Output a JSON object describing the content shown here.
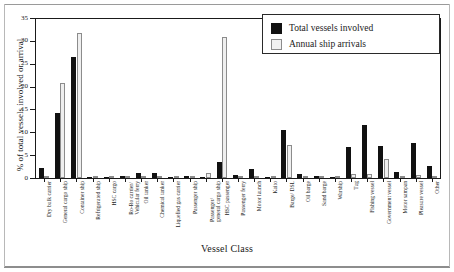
{
  "chart_data": {
    "type": "bar",
    "title": "",
    "xlabel": "Vessel Class",
    "ylabel": "% of total vessels involved or arrival",
    "ylim": [
      0,
      35
    ],
    "yticks": [
      0,
      5,
      10,
      15,
      20,
      25,
      30,
      35
    ],
    "grid": false,
    "legend_position": "top-right",
    "categories": [
      "Dry bulk carrier",
      "General cargo ship",
      "Container ship",
      "Refrigerated ship",
      "HSC cargo",
      "Ro-Ro carrier/ Vehicular ferry",
      "Oil tanker",
      "Chemical tanker",
      "Liquefied gas carrier",
      "Passenger ship",
      "Passenger/ general cargo ship",
      "HSC passenger",
      "Passenger ferry",
      "Motor launch",
      "Kaito",
      "Barge/ DSL",
      "Oil barge",
      "Sand barge",
      "Warship",
      "Tug",
      "Fishing vessel",
      "Government vessel",
      "Motor sampan",
      "Pleasure vessel",
      "Other"
    ],
    "series": [
      {
        "name": "Total vessels involved",
        "color": "#111111",
        "values": [
          2.3,
          14.2,
          26.5,
          0.2,
          0.2,
          0.5,
          1.2,
          1.1,
          0.2,
          0.5,
          0.3,
          3.4,
          0.6,
          2.0,
          0.2,
          10.6,
          0.8,
          0.4,
          0.3,
          6.8,
          11.6,
          7.1,
          1.3,
          7.6,
          2.6
        ]
      },
      {
        "name": "Annual ship arrivals",
        "color": "#efefef",
        "values": [
          0.4,
          20.7,
          31.7,
          0.1,
          0.1,
          0.5,
          0.5,
          0.3,
          0.1,
          0.3,
          1.1,
          30.8,
          0.5,
          0.3,
          0.2,
          7.3,
          0.3,
          0.2,
          0.1,
          0.9,
          0.8,
          4.1,
          0.2,
          0.7,
          0.5
        ]
      }
    ]
  },
  "legend": {
    "items": [
      {
        "label": "Total vessels involved",
        "swatch": "dark"
      },
      {
        "label": "Annual ship arrivals",
        "swatch": "light"
      }
    ]
  }
}
